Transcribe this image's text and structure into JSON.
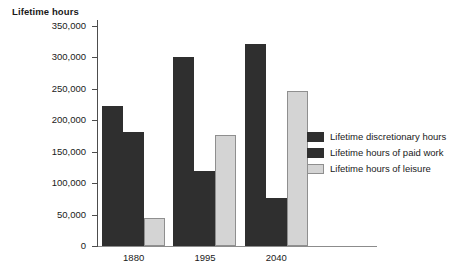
{
  "chart_data": {
    "type": "bar",
    "title": "Lifetime hours",
    "xlabel": "",
    "ylabel": "Lifetime hours",
    "categories": [
      "1880",
      "1995",
      "2040"
    ],
    "ylim": [
      0,
      350000
    ],
    "ytick_values": [
      0,
      50000,
      100000,
      150000,
      200000,
      250000,
      300000,
      350000
    ],
    "ytick_labels": [
      "0",
      "50,000",
      "100,000",
      "150,000",
      "200,000",
      "250,000",
      "300,000",
      "350,000"
    ],
    "grid": false,
    "legend_position": "right",
    "series": [
      {
        "name": "Lifetime discretionary hours",
        "color": "#2f2f2f",
        "values": [
          222000,
          300000,
          322000
        ]
      },
      {
        "name": "Lifetime hours of paid work",
        "color": "#2f2f2f",
        "values": [
          182000,
          120000,
          77000
        ]
      },
      {
        "name": "Lifetime hours of leisure",
        "color": "#d4d4d4",
        "values": [
          45000,
          176000,
          247000
        ]
      }
    ]
  }
}
